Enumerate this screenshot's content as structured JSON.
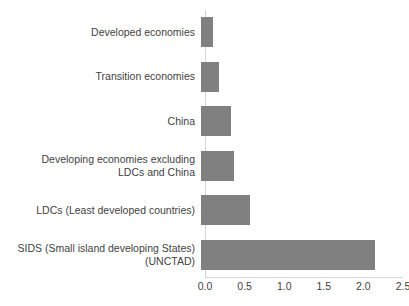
{
  "chart_data": {
    "type": "bar",
    "orientation": "horizontal",
    "title": "",
    "subtitle": "",
    "xlabel": "",
    "ylabel": "",
    "xlim": [
      0.0,
      2.5
    ],
    "xticks": [
      "0.0",
      "0.5",
      "1.0",
      "1.5",
      "2.0",
      "2.5"
    ],
    "xtick_values": [
      0.0,
      0.5,
      1.0,
      1.5,
      2.0,
      2.5
    ],
    "grid": false,
    "legend": false,
    "bar_color": "#808080",
    "axis_color": "#d4d4d4",
    "text_color": "#3f3f3f",
    "categories": [
      "Developed economies",
      "Transition economies",
      "China",
      "Developing economies excluding\nLDCs and China",
      "LDCs (Least developed countries)",
      "SIDS (Small island developing States)\n(UNCTAD)"
    ],
    "values": [
      0.15,
      0.23,
      0.38,
      0.42,
      0.62,
      2.2
    ]
  }
}
